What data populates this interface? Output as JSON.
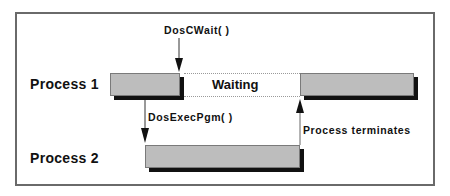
{
  "diagram": {
    "type": "process-timeline",
    "rows": [
      {
        "label": "Process 1"
      },
      {
        "label": "Process 2"
      }
    ],
    "states": {
      "waiting_label": "Waiting"
    },
    "events": [
      {
        "id": "doscwait",
        "label": "DosCWait( )",
        "direction": "down",
        "target": "Process 1"
      },
      {
        "id": "dosexecpgm",
        "label": "DosExecPgm( )",
        "direction": "down",
        "from": "Process 1",
        "to": "Process 2"
      },
      {
        "id": "terminates",
        "label": "Process terminates",
        "direction": "up",
        "from": "Process 2",
        "to": "Process 1"
      }
    ],
    "colors": {
      "bar_fill": "#bdbdbd",
      "bar_shadow": "#111111",
      "frame": "#6a6a6a",
      "dotted": "#9a9a9a"
    }
  }
}
